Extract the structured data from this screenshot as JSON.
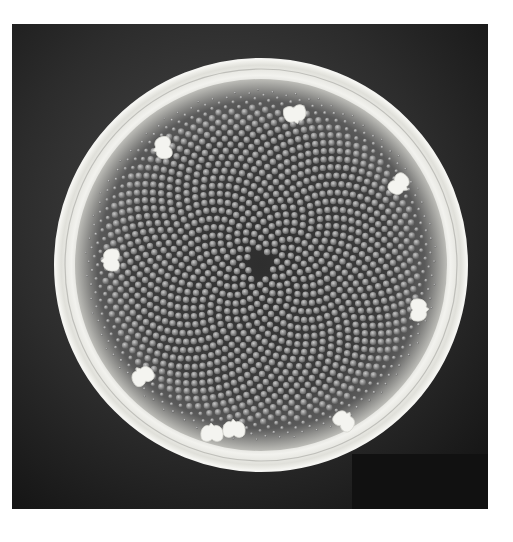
{
  "image": {
    "kind": "scanning electron micrograph",
    "subject": "circular centric diatom valve with radial areolae and marginal processes",
    "colors": {
      "page_background": "#ffffff",
      "photo_background": "#2a2a2a",
      "rim": "#e6e6e0",
      "valve_face": "#3a3a3a",
      "areola": "#9a9a9a",
      "process": "#f4f4f0"
    },
    "valve": {
      "cx": 249,
      "cy": 241,
      "outer_r": 206,
      "inner_r": 186,
      "face_r": 176
    },
    "marginal_processes": [
      {
        "x": 283,
        "y": 91,
        "angle": -10
      },
      {
        "x": 150,
        "y": 124,
        "angle": 80
      },
      {
        "x": 98,
        "y": 236,
        "angle": 90
      },
      {
        "x": 130,
        "y": 351,
        "angle": 150
      },
      {
        "x": 200,
        "y": 408,
        "angle": 180
      },
      {
        "x": 222,
        "y": 404,
        "angle": 180
      },
      {
        "x": 333,
        "y": 396,
        "angle": 220
      },
      {
        "x": 408,
        "y": 286,
        "angle": 270
      },
      {
        "x": 388,
        "y": 161,
        "angle": 310
      }
    ]
  }
}
